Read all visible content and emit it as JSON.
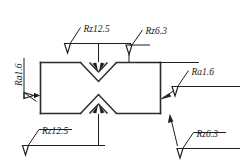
{
  "drawing": {
    "title": "Surface roughness symbol drawing",
    "type": "engineering-drawing",
    "units": "micrometres",
    "line_color": "#2b2b2b",
    "text_color": "#1a1a1a",
    "background": "#ffffff"
  },
  "annotations": {
    "top": {
      "id": "top-notch-annotation",
      "label": "Rz12.5",
      "parameter": "Rz",
      "value": "12.5",
      "target": "top-vee-notch-flanks",
      "symbol": "surface-roughness-triangle"
    },
    "top_right": {
      "id": "top-face-annotation",
      "label": "Rz6.3",
      "parameter": "Rz",
      "value": "6.3",
      "target": "top-face",
      "symbol": "surface-roughness-triangle"
    },
    "left": {
      "id": "left-face-annotation",
      "label": "Ra1.6",
      "parameter": "Ra",
      "value": "1.6",
      "target": "left-face",
      "symbol": "surface-roughness-triangle",
      "rotated": "90"
    },
    "right": {
      "id": "right-face-annotation",
      "label": "Ra1.6",
      "parameter": "Ra",
      "value": "1.6",
      "target": "right-face",
      "symbol": "surface-roughness-triangle"
    },
    "bottom_left": {
      "id": "bottom-notch-annotation",
      "label": "Rz12.5",
      "parameter": "Rz",
      "value": "12.5",
      "target": "bottom-vee-notch-flanks",
      "symbol": "surface-roughness-triangle"
    },
    "bottom_right": {
      "id": "bottom-face-annotation",
      "label": "Rz6.3",
      "parameter": "Rz",
      "value": "6.3",
      "target": "bottom-face",
      "symbol": "surface-roughness-triangle"
    }
  }
}
